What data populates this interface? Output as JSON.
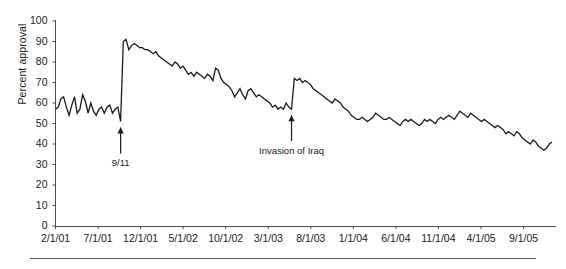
{
  "chart_data": {
    "type": "line",
    "title": "",
    "subtitle": "",
    "xlabel": "",
    "ylabel": "Percent approval",
    "ylim": [
      0,
      100
    ],
    "yticks": [
      0,
      10,
      20,
      30,
      40,
      50,
      60,
      70,
      80,
      90,
      100
    ],
    "xticks": [
      "2/1/01",
      "7/1/01",
      "12/1/01",
      "5/1/02",
      "10/1/02",
      "3/1/03",
      "8/1/03",
      "1/1/04",
      "6/1/04",
      "11/1/04",
      "4/1/05",
      "9/1/05"
    ],
    "grid": false,
    "legend": null,
    "series": [
      {
        "name": "Percent approval",
        "color": "#1a1a1a",
        "x": [
          0,
          1,
          2,
          3,
          4,
          5,
          6,
          7,
          8,
          9,
          10,
          11,
          12,
          13,
          14,
          15,
          16,
          17,
          18,
          19,
          20,
          21,
          22,
          23,
          24,
          25,
          26,
          27,
          28,
          29,
          30,
          31,
          32,
          33,
          34,
          35,
          36,
          37,
          38,
          39,
          40,
          41,
          42,
          43,
          44,
          45,
          46,
          47,
          48,
          49,
          50,
          51,
          52,
          53,
          54,
          55,
          56,
          57,
          58,
          59,
          60,
          61,
          62,
          63,
          64,
          65,
          66,
          67,
          68,
          69,
          70,
          71,
          72,
          73,
          74,
          75,
          76,
          77,
          78,
          79,
          80,
          81,
          82,
          83,
          84,
          85,
          86,
          87,
          88,
          89,
          90,
          91,
          92,
          93,
          94,
          95,
          96,
          97,
          98,
          99,
          100,
          101,
          102,
          103,
          104,
          105,
          106,
          107,
          108,
          109,
          110,
          111,
          112,
          113,
          114,
          115,
          116,
          117,
          118,
          119,
          120,
          121,
          122,
          123,
          124,
          125,
          126,
          127,
          128,
          129,
          130,
          131,
          132,
          133,
          134,
          135,
          136,
          137,
          138,
          139,
          140,
          141,
          142,
          143,
          144,
          145,
          146,
          147,
          148,
          149,
          150,
          151,
          152,
          153,
          154,
          155,
          156,
          157,
          158,
          159,
          160,
          161,
          162,
          163,
          164,
          165,
          166,
          167,
          168,
          169,
          170,
          171,
          172,
          173,
          174,
          175,
          176,
          177,
          178,
          179,
          180,
          181,
          182,
          183
        ],
        "values": [
          57,
          58,
          62,
          63,
          58,
          54,
          59,
          63,
          55,
          57,
          64,
          61,
          55,
          60,
          56,
          54,
          57,
          58,
          55,
          58,
          59,
          55,
          57,
          58,
          51,
          90,
          91,
          86,
          88,
          89,
          88,
          87,
          87,
          86,
          86,
          85,
          84,
          85,
          83,
          82,
          81,
          80,
          79,
          78,
          80,
          79,
          77,
          78,
          76,
          74,
          75,
          73,
          75,
          74,
          73,
          72,
          74,
          73,
          71,
          77,
          76,
          72,
          70,
          69,
          68,
          66,
          63,
          65,
          67,
          64,
          62,
          66,
          67,
          65,
          63,
          64,
          63,
          62,
          61,
          60,
          58,
          59,
          57,
          58,
          57,
          60,
          58,
          57,
          72,
          71,
          72,
          70,
          71,
          70,
          69,
          67,
          66,
          65,
          64,
          63,
          62,
          61,
          60,
          62,
          61,
          60,
          58,
          57,
          56,
          54,
          53,
          52,
          52,
          53,
          52,
          51,
          52,
          53,
          55,
          54,
          53,
          52,
          52,
          53,
          52,
          51,
          50,
          49,
          51,
          52,
          51,
          52,
          51,
          50,
          49,
          50,
          52,
          51,
          52,
          51,
          50,
          52,
          53,
          52,
          53,
          54,
          53,
          52,
          54,
          56,
          55,
          54,
          53,
          55,
          54,
          53,
          52,
          51,
          52,
          51,
          50,
          49,
          48,
          49,
          48,
          47,
          45,
          46,
          45,
          44,
          46,
          45,
          43,
          42,
          41,
          40,
          42,
          41,
          39,
          38,
          37,
          38,
          40,
          41
        ]
      }
    ],
    "annotations": [
      {
        "label": "9/11",
        "x_index": 24,
        "value": 51,
        "arrow": "up"
      },
      {
        "label": "Invasion of Iraq",
        "x_index": 87,
        "value": 57,
        "arrow": "up"
      }
    ]
  },
  "axis": {
    "y_label": "Percent approval",
    "y_ticks": [
      "100",
      "90",
      "80",
      "70",
      "60",
      "50",
      "40",
      "30",
      "20",
      "10",
      "0"
    ],
    "x_ticks": [
      "2/1/01",
      "7/1/01",
      "12/1/01",
      "5/1/02",
      "10/1/02",
      "3/1/03",
      "8/1/03",
      "1/1/04",
      "6/1/04",
      "11/1/04",
      "4/1/05",
      "9/1/05"
    ]
  },
  "annotations": {
    "nine_eleven": "9/11",
    "iraq": "Invasion of Iraq"
  },
  "colors": {
    "line": "#1a1a1a",
    "axis": "#4d4d4d",
    "rule": "#5a5a5a",
    "background": "#ffffff"
  }
}
